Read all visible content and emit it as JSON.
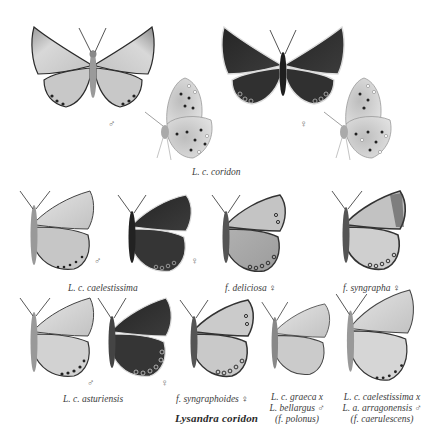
{
  "plate": {
    "title": "Lysandra coridon",
    "colors": {
      "background": "#ffffff",
      "male_wing": "#c9c9c9",
      "female_wing": "#2e2e2e",
      "underside_wing": "#d4d4d4",
      "border": "#1c1c1c",
      "text": "#3c3c3c"
    }
  },
  "row1": {
    "caption": "L. c. coridon",
    "specimens": [
      {
        "id": "coridon-male-upperside",
        "view": "upperside",
        "sex_symbol": "♂"
      },
      {
        "id": "coridon-male-underside",
        "view": "underside"
      },
      {
        "id": "coridon-female-upperside",
        "view": "upperside",
        "sex_symbol": "♀"
      },
      {
        "id": "coridon-female-underside",
        "view": "underside"
      }
    ]
  },
  "row2": {
    "specimens": [
      {
        "id": "caelestissima-male",
        "sex_symbol": "♂"
      },
      {
        "id": "caelestissima-female",
        "sex_symbol": "♀"
      },
      {
        "id": "deliciosa-female",
        "label": "f. deliciosa",
        "sex_symbol": "♀"
      },
      {
        "id": "syngrapha-female",
        "label": "f. syngrapha",
        "sex_symbol": "♀"
      }
    ],
    "caption_caelestissima": "L. c. caelestissima"
  },
  "row3": {
    "specimens": [
      {
        "id": "asturiensis-male",
        "sex_symbol": "♂"
      },
      {
        "id": "asturiensis-female",
        "sex_symbol": "♀"
      },
      {
        "id": "syngraphoides-female",
        "label": "f. syngraphoides",
        "sex_symbol": "♀"
      },
      {
        "id": "polonus-hybrid",
        "label_lines": [
          "L. c. graeca x",
          "L. bellargus",
          "(f. polonus)"
        ],
        "sex_symbol": "♂"
      },
      {
        "id": "caerulescens-hybrid",
        "label_lines": [
          "L. c. caelestissima x",
          "L. a. arragonensis",
          "(f. caerulescens)"
        ],
        "sex_symbol": "♂"
      }
    ],
    "caption_asturiensis": "L. c. asturiensis"
  }
}
